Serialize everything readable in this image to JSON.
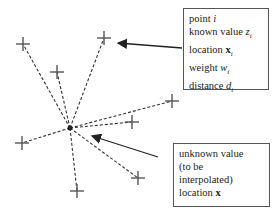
{
  "known_box": {
    "lines": [
      {
        "text": "point ",
        "var": "i",
        "var_style": "italic",
        "sub": ""
      },
      {
        "text": "known value ",
        "var": "z",
        "var_style": "italic",
        "sub": "i"
      },
      {
        "text": "location ",
        "var": "x",
        "var_style": "bold",
        "sub": "i"
      },
      {
        "text": "weight ",
        "var": "w",
        "var_style": "italic",
        "sub": "i"
      },
      {
        "text": "distance ",
        "var": "d",
        "var_style": "italic",
        "sub": "i"
      }
    ]
  },
  "unknown_box": {
    "lines": [
      "unknown value",
      "(to be",
      "interpolated)"
    ],
    "location_label": "location ",
    "location_var": "x"
  },
  "center_point": {
    "x": 70,
    "y": 128
  },
  "known_points": [
    {
      "x": 23,
      "y": 44
    },
    {
      "x": 57,
      "y": 72
    },
    {
      "x": 104,
      "y": 38
    },
    {
      "x": 172,
      "y": 101
    },
    {
      "x": 132,
      "y": 122
    },
    {
      "x": 22,
      "y": 143
    },
    {
      "x": 138,
      "y": 178
    },
    {
      "x": 77,
      "y": 191
    }
  ],
  "arrows": [
    {
      "from": [
        182,
        48
      ],
      "to": [
        118,
        43
      ]
    },
    {
      "from": [
        158,
        157
      ],
      "to": [
        92,
        136
      ]
    }
  ],
  "colors": {
    "line": "#333333",
    "marker": "#555555",
    "box_border": "#555555"
  }
}
